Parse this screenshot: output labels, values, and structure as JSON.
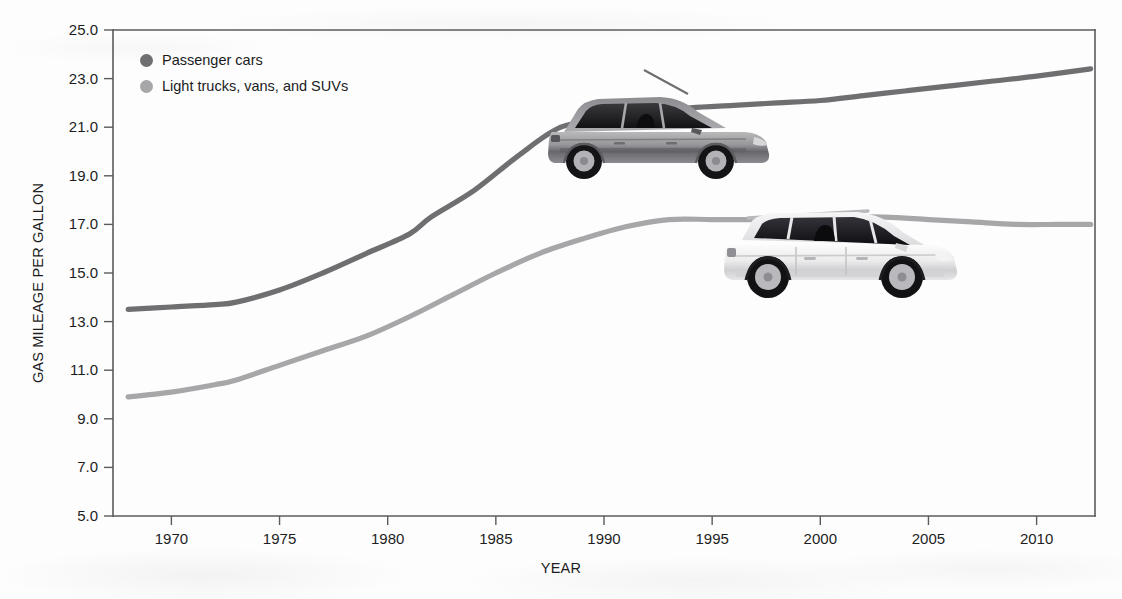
{
  "chart_data": {
    "type": "line",
    "title": "",
    "xlabel": "YEAR",
    "ylabel": "GAS MILEAGE PER GALLON",
    "xlim": [
      1967.3,
      2012.7
    ],
    "ylim": [
      5.0,
      25.0
    ],
    "grid": false,
    "legend_position": "top-left",
    "xticks": [
      1970,
      1975,
      1980,
      1985,
      1990,
      1995,
      2000,
      2005,
      2010
    ],
    "xtick_labels": [
      "1970",
      "1975",
      "1980",
      "1985",
      "1990",
      "1995",
      "2000",
      "2005",
      "2010"
    ],
    "yticks": [
      5.0,
      7.0,
      9.0,
      11.0,
      13.0,
      15.0,
      17.0,
      19.0,
      21.0,
      23.0,
      25.0
    ],
    "ytick_labels": [
      "5.0",
      "7.0",
      "9.0",
      "11.0",
      "13.0",
      "15.0",
      "17.0",
      "19.0",
      "21.0",
      "23.0",
      "25.0"
    ],
    "series": [
      {
        "name": "Passenger cars",
        "color": "#6f6f71",
        "x": [
          1968,
          1970,
          1972,
          1973,
          1975,
          1977,
          1979,
          1981,
          1982,
          1984,
          1986,
          1988,
          1990,
          1992,
          1994,
          1996,
          1998,
          2000,
          2002,
          2004,
          2006,
          2008,
          2010,
          2012.5
        ],
        "values": [
          13.5,
          13.6,
          13.7,
          13.8,
          14.3,
          15.0,
          15.8,
          16.6,
          17.3,
          18.4,
          19.8,
          21.0,
          21.3,
          21.6,
          21.8,
          21.9,
          22.0,
          22.1,
          22.3,
          22.5,
          22.7,
          22.9,
          23.1,
          23.4
        ]
      },
      {
        "name": "Light trucks, vans, and SUVs",
        "color": "#a7a7a9",
        "x": [
          1968,
          1970,
          1972,
          1973,
          1975,
          1977,
          1979,
          1981,
          1983,
          1985,
          1987,
          1989,
          1991,
          1993,
          1995,
          1997,
          1999,
          2001,
          2003,
          2005,
          2007,
          2009,
          2011,
          2012.5
        ],
        "values": [
          9.9,
          10.1,
          10.4,
          10.6,
          11.2,
          11.8,
          12.4,
          13.2,
          14.1,
          15.0,
          15.8,
          16.4,
          16.9,
          17.2,
          17.2,
          17.2,
          17.2,
          17.3,
          17.3,
          17.2,
          17.1,
          17.0,
          17.0,
          17.0
        ]
      }
    ]
  },
  "legend": {
    "items": [
      {
        "label": "Passenger cars",
        "color": "#6f6f71"
      },
      {
        "label": "Light trucks, vans, and SUVs",
        "color": "#a7a7a9"
      }
    ]
  },
  "axes": {
    "y_title": "GAS MILEAGE PER GALLON",
    "x_title": "YEAR"
  },
  "images": {
    "passenger_car": "passenger-car-illustration",
    "suv": "suv-illustration"
  }
}
